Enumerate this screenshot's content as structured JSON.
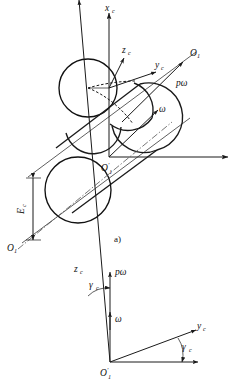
{
  "figure": {
    "caption_a": "a)",
    "upper": {
      "axis_x_label": "x",
      "axis_x_sub": "c",
      "axis_z_label": "z",
      "axis_z_sub": "c",
      "axis_y_label": "y",
      "axis_y_sub": "c",
      "origin_label": "O",
      "origin_prime": "′",
      "origin_sub": "1",
      "pole_upper_label": "O",
      "pole_upper_sub": "1",
      "pole_lower_label": "O",
      "pole_lower_sub": "1",
      "vector_pomega": "pω",
      "vector_omega": "ω",
      "dimension_label": "E",
      "dimension_sub": "c"
    },
    "lower": {
      "axis_z_label": "z",
      "axis_z_sub": "c",
      "axis_y_label": "y",
      "axis_y_sub": "c",
      "vector_pomega": "pω",
      "vector_omega": "ω",
      "angle_left_label": "γ",
      "angle_left_sub": "c",
      "angle_right_label": "γ",
      "angle_right_sub": "c",
      "origin_label": "O",
      "origin_prime": "′",
      "origin_sub": "1"
    }
  },
  "colors": {
    "stroke": "#1a1a1a",
    "background": "#ffffff",
    "axis_light": "#555555"
  }
}
